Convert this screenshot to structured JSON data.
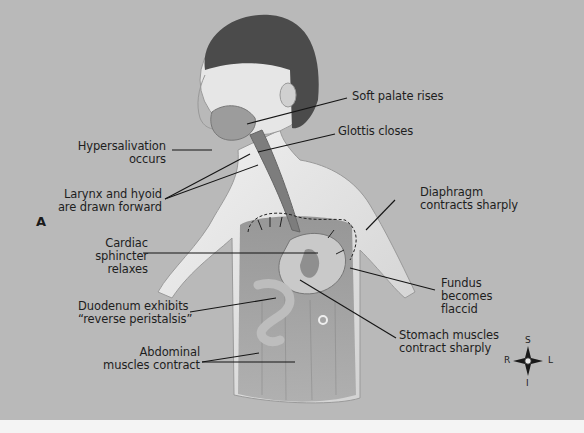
{
  "figure": {
    "panel_letter": "A",
    "background_color": "#b9b9b9",
    "labels": {
      "soft_palate": [
        "Soft palate rises"
      ],
      "glottis": [
        "Glottis closes"
      ],
      "hypersalivation": [
        "Hypersalivation",
        "occurs"
      ],
      "larynx": [
        "Larynx and hyoid",
        "are drawn forward"
      ],
      "diaphragm": [
        "Diaphragm",
        "contracts sharply"
      ],
      "cardiac": [
        "Cardiac",
        "sphincter",
        "relaxes"
      ],
      "fundus": [
        "Fundus",
        "becomes",
        "flaccid"
      ],
      "duodenum": [
        "Duodenum exhibits",
        "“reverse peristalsis”"
      ],
      "stomach": [
        "Stomach muscles",
        "contract sharply"
      ],
      "abdominal": [
        "Abdominal",
        "muscles contract"
      ]
    },
    "compass": {
      "superior": "S",
      "inferior": "I",
      "right": "R",
      "left": "L"
    }
  }
}
